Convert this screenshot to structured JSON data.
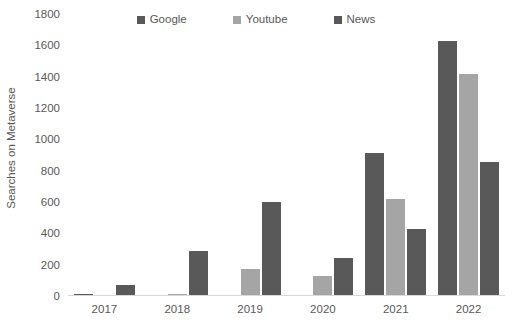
{
  "chart_data": {
    "type": "bar",
    "title": "",
    "subtitle": "",
    "xlabel": "",
    "ylabel": "Searches on Metaverse",
    "categories": [
      "2017",
      "2018",
      "2019",
      "2020",
      "2021",
      "2022"
    ],
    "series": [
      {
        "name": "Google",
        "color": "#595959",
        "values": [
          10,
          5,
          2,
          3,
          915,
          1625
        ]
      },
      {
        "name": "Youtube",
        "color": "#a5a5a5",
        "values": [
          8,
          15,
          170,
          125,
          620,
          1415
        ]
      },
      {
        "name": "News",
        "color": "#595959",
        "values": [
          70,
          285,
          600,
          240,
          430,
          855
        ]
      }
    ],
    "ylim": [
      0,
      1800
    ],
    "yticks": [
      0,
      200,
      400,
      600,
      800,
      1000,
      1200,
      1400,
      1600,
      1800
    ],
    "ytick_labels": [
      "0",
      "200",
      "400",
      "600",
      "800",
      "1000",
      "1200",
      "1400",
      "1600",
      "1800"
    ],
    "grid": false,
    "legend_position": "top-center",
    "legend_marker": "square"
  },
  "legend": {
    "entries": [
      {
        "label": "Google",
        "color": "#595959"
      },
      {
        "label": "Youtube",
        "color": "#a5a5a5"
      },
      {
        "label": "News",
        "color": "#595959"
      }
    ]
  },
  "axes": {
    "y_title": "Searches on Metaverse",
    "baseline_color": "#d9d9d9",
    "text_color": "#585858"
  }
}
